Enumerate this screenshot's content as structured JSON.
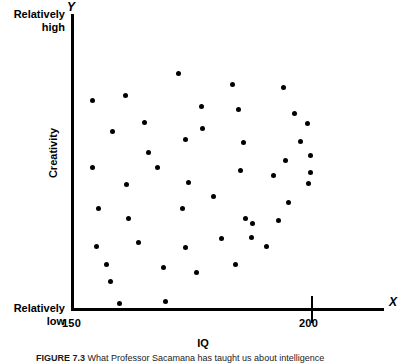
{
  "figure": {
    "axis_letter_y": "Y",
    "axis_letter_x": "X",
    "y_title": "Creativity",
    "x_title": "IQ",
    "y_high_label": "Relatively\nhigh",
    "y_high_line1": "Relatively",
    "y_high_line2": "high",
    "y_low_line1": "Relatively",
    "y_low_line2": "low",
    "x_min_label": "150",
    "x_max_label": "200",
    "caption_prefix": "FIGURE 7.3",
    "caption_text": "What Professor Sacamana has taught us about intelligence",
    "ink_color": "#000000",
    "background_color": "#ffffff"
  },
  "chart_data": {
    "type": "scatter",
    "title": "",
    "xlabel": "IQ",
    "ylabel": "Creativity",
    "xlim": [
      150,
      212
    ],
    "ylim": [
      0,
      100
    ],
    "x_ticks": [
      150,
      200
    ],
    "x_tick_labels": [
      "150",
      "200"
    ],
    "y_tick_labels": [
      "Relatively low",
      "Relatively high"
    ],
    "grid": false,
    "legend": false,
    "marker": "filled-circle",
    "marker_color": "#000000",
    "marker_size_px": 5,
    "n_points": 47,
    "points_px": [
      [
        92,
        100
      ],
      [
        125,
        95
      ],
      [
        178,
        73
      ],
      [
        144,
        122
      ],
      [
        112,
        131
      ],
      [
        185,
        139
      ],
      [
        232,
        84
      ],
      [
        283,
        87
      ],
      [
        201,
        106
      ],
      [
        238,
        109
      ],
      [
        202,
        128
      ],
      [
        294,
        113
      ],
      [
        307,
        123
      ],
      [
        243,
        142
      ],
      [
        310,
        155
      ],
      [
        310,
        172
      ],
      [
        92,
        167
      ],
      [
        157,
        167
      ],
      [
        126,
        184
      ],
      [
        188,
        182
      ],
      [
        98,
        208
      ],
      [
        182,
        208
      ],
      [
        128,
        218
      ],
      [
        285,
        160
      ],
      [
        240,
        170
      ],
      [
        273,
        175
      ],
      [
        308,
        183
      ],
      [
        288,
        202
      ],
      [
        245,
        218
      ],
      [
        252,
        223
      ],
      [
        278,
        220
      ],
      [
        138,
        242
      ],
      [
        185,
        247
      ],
      [
        251,
        237
      ],
      [
        221,
        238
      ],
      [
        106,
        264
      ],
      [
        163,
        267
      ],
      [
        196,
        272
      ],
      [
        235,
        264
      ],
      [
        110,
        281
      ],
      [
        119,
        303
      ],
      [
        165,
        301
      ],
      [
        96,
        246
      ],
      [
        213,
        196
      ],
      [
        266,
        246
      ],
      [
        300,
        141
      ],
      [
        148,
        152
      ]
    ],
    "points_data": [
      [
        153.9,
        70.8
      ],
      [
        160.4,
        72.5
      ],
      [
        170.9,
        79.9
      ],
      [
        164.3,
        63.8
      ],
      [
        157.9,
        60.7
      ],
      [
        172.3,
        57.9
      ],
      [
        181.6,
        76.2
      ],
      [
        191.8,
        75.2
      ],
      [
        175.7,
        68.6
      ],
      [
        183.0,
        67.6
      ],
      [
        175.9,
        60.9
      ],
      [
        194.0,
        66.0
      ],
      [
        196.6,
        62.6
      ],
      [
        184.0,
        56.8
      ],
      [
        197.2,
        52.2
      ],
      [
        197.2,
        46.4
      ],
      [
        153.9,
        52.6
      ],
      [
        166.9,
        52.6
      ],
      [
        160.6,
        46.8
      ],
      [
        173.0,
        47.5
      ],
      [
        155.1,
        38.8
      ],
      [
        171.8,
        38.8
      ],
      [
        161.0,
        35.4
      ],
      [
        181.2,
        55.2
      ],
      [
        192.0,
        51.9
      ],
      [
        180.1,
        49.2
      ],
      [
        196.9,
        44.4
      ],
      [
        192.6,
        37.9
      ],
      [
        183.4,
        32.4
      ],
      [
        184.8,
        30.7
      ],
      [
        190.0,
        31.7
      ],
      [
        162.9,
        32.8
      ],
      [
        172.3,
        31.0
      ],
      [
        184.0,
        35.0
      ],
      [
        178.0,
        34.6
      ],
      [
        157.5,
        24.1
      ],
      [
        168.9,
        23.0
      ],
      [
        175.5,
        21.4
      ],
      [
        183.3,
        24.1
      ],
      [
        158.3,
        18.0
      ],
      [
        160.1,
        10.4
      ],
      [
        169.3,
        11.1
      ],
      [
        154.7,
        30.4
      ],
      [
        178.0,
        47.8
      ],
      [
        188.6,
        30.4
      ],
      [
        195.4,
        62.1
      ],
      [
        165.1,
        65.0
      ]
    ]
  }
}
